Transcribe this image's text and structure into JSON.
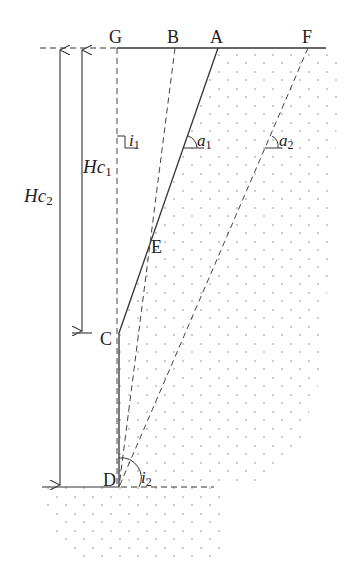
{
  "diagram": {
    "type": "slope-cross-section",
    "points": {
      "G": {
        "label": "G",
        "x": 117,
        "y": 48
      },
      "B": {
        "label": "B",
        "x": 175,
        "y": 48
      },
      "A": {
        "label": "A",
        "x": 218,
        "y": 48
      },
      "F": {
        "label": "F",
        "x": 308,
        "y": 48
      },
      "E": {
        "label": "E",
        "x": 148,
        "y": 245
      },
      "C": {
        "label": "C",
        "x": 119,
        "y": 333
      },
      "D": {
        "label": "D",
        "x": 119,
        "y": 487
      }
    },
    "dimensions": {
      "hc1": {
        "main": "Hc",
        "sub": "1"
      },
      "hc2": {
        "main": "Hc",
        "sub": "2"
      }
    },
    "angles": {
      "i1": {
        "main": "i",
        "sub": "1"
      },
      "a1": {
        "main": "a",
        "sub": "1"
      },
      "a2": {
        "main": "a",
        "sub": "2"
      },
      "i2": {
        "main": "i",
        "sub": "2"
      }
    },
    "colors": {
      "line": "#333333",
      "dots": "#888888"
    }
  }
}
